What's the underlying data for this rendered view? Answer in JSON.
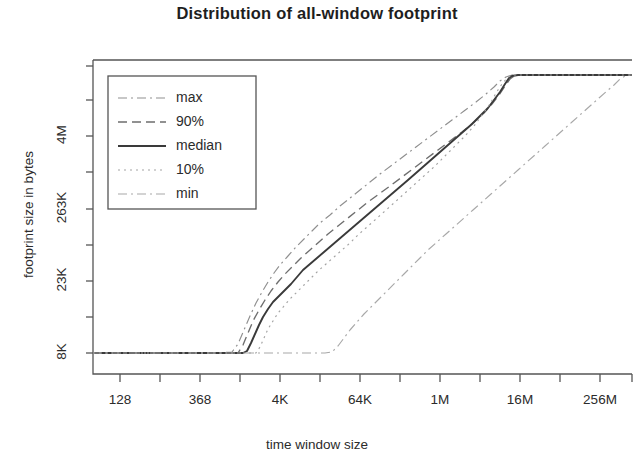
{
  "chart_data": {
    "type": "line",
    "title": "Distribution of all-window footprint",
    "xlabel": "time window size",
    "ylabel": "footprint size in bytes",
    "grid": false,
    "legend_position": "top-left",
    "x_tick_labels": [
      "128",
      "",
      "368",
      "",
      "4K",
      "",
      "64K",
      "",
      "1M",
      "",
      "16M",
      "",
      "256M",
      ""
    ],
    "y_tick_labels": [
      "8K",
      "",
      "23K",
      "",
      "263K",
      "",
      "4M",
      "",
      ""
    ],
    "xlim_labels": [
      "128",
      "256M"
    ],
    "ylim_labels": [
      "8K",
      "4M"
    ],
    "legend": [
      {
        "name": "max",
        "style": "dashdot",
        "color": "#8f8f8f"
      },
      {
        "name": "90%",
        "style": "dashed",
        "color": "#6e6e6e"
      },
      {
        "name": "median",
        "style": "solid",
        "color": "#3a3a3a"
      },
      {
        "name": "10%",
        "style": "dotted",
        "color": "#a3a3a3"
      },
      {
        "name": "min",
        "style": "dashdot",
        "color": "#a8a8a8"
      }
    ],
    "series": [
      {
        "name": "max",
        "style": "dashdot",
        "color": "#8f8f8f",
        "points": [
          [
            93,
            353
          ],
          [
            140,
            353
          ],
          [
            180,
            353
          ],
          [
            215,
            353
          ],
          [
            232,
            352
          ],
          [
            238,
            344
          ],
          [
            244,
            330
          ],
          [
            250,
            316
          ],
          [
            256,
            303
          ],
          [
            262,
            292
          ],
          [
            268,
            282
          ],
          [
            274,
            273
          ],
          [
            280,
            265
          ],
          [
            288,
            256
          ],
          [
            296,
            247
          ],
          [
            304,
            239
          ],
          [
            312,
            231
          ],
          [
            320,
            223
          ],
          [
            330,
            215
          ],
          [
            340,
            206
          ],
          [
            350,
            198
          ],
          [
            360,
            190
          ],
          [
            370,
            182
          ],
          [
            380,
            174
          ],
          [
            392,
            165
          ],
          [
            404,
            156
          ],
          [
            416,
            147
          ],
          [
            428,
            138
          ],
          [
            440,
            129
          ],
          [
            452,
            120
          ],
          [
            464,
            111
          ],
          [
            476,
            102
          ],
          [
            486,
            94
          ],
          [
            494,
            87
          ],
          [
            500,
            81
          ],
          [
            506,
            77
          ],
          [
            512,
            75
          ],
          [
            530,
            75
          ],
          [
            560,
            75
          ],
          [
            600,
            75
          ],
          [
            632,
            75
          ]
        ]
      },
      {
        "name": "90%",
        "style": "dashed",
        "color": "#6e6e6e",
        "points": [
          [
            93,
            353
          ],
          [
            150,
            353
          ],
          [
            200,
            353
          ],
          [
            230,
            353
          ],
          [
            238,
            353
          ],
          [
            243,
            345
          ],
          [
            248,
            333
          ],
          [
            253,
            321
          ],
          [
            259,
            310
          ],
          [
            265,
            300
          ],
          [
            271,
            291
          ],
          [
            278,
            282
          ],
          [
            285,
            274
          ],
          [
            293,
            266
          ],
          [
            301,
            258
          ],
          [
            310,
            250
          ],
          [
            319,
            242
          ],
          [
            328,
            234
          ],
          [
            338,
            226
          ],
          [
            348,
            218
          ],
          [
            358,
            210
          ],
          [
            368,
            202
          ],
          [
            379,
            194
          ],
          [
            390,
            186
          ],
          [
            402,
            177
          ],
          [
            414,
            168
          ],
          [
            426,
            159
          ],
          [
            438,
            150
          ],
          [
            450,
            141
          ],
          [
            462,
            132
          ],
          [
            474,
            122
          ],
          [
            484,
            113
          ],
          [
            492,
            104
          ],
          [
            499,
            95
          ],
          [
            505,
            86
          ],
          [
            510,
            79
          ],
          [
            514,
            76
          ],
          [
            520,
            75
          ],
          [
            560,
            75
          ],
          [
            600,
            75
          ],
          [
            632,
            75
          ]
        ]
      },
      {
        "name": "median",
        "style": "solid",
        "color": "#3a3a3a",
        "points": [
          [
            93,
            353
          ],
          [
            160,
            353
          ],
          [
            210,
            353
          ],
          [
            235,
            353
          ],
          [
            243,
            353
          ],
          [
            247,
            351
          ],
          [
            251,
            343
          ],
          [
            255,
            334
          ],
          [
            259,
            325
          ],
          [
            263,
            317
          ],
          [
            268,
            309
          ],
          [
            273,
            302
          ],
          [
            279,
            296
          ],
          [
            285,
            290
          ],
          [
            291,
            284
          ],
          [
            297,
            277
          ],
          [
            303,
            270
          ],
          [
            310,
            264
          ],
          [
            317,
            258
          ],
          [
            324,
            252
          ],
          [
            331,
            246
          ],
          [
            338,
            240
          ],
          [
            345,
            234
          ],
          [
            352,
            228
          ],
          [
            359,
            222
          ],
          [
            366,
            216
          ],
          [
            373,
            210
          ],
          [
            380,
            204
          ],
          [
            387,
            198
          ],
          [
            394,
            192
          ],
          [
            401,
            186
          ],
          [
            408,
            180
          ],
          [
            416,
            173
          ],
          [
            424,
            166
          ],
          [
            432,
            159
          ],
          [
            440,
            152
          ],
          [
            448,
            145
          ],
          [
            456,
            138
          ],
          [
            464,
            131
          ],
          [
            472,
            124
          ],
          [
            480,
            116
          ],
          [
            488,
            108
          ],
          [
            494,
            100
          ],
          [
            500,
            92
          ],
          [
            505,
            84
          ],
          [
            509,
            78
          ],
          [
            512,
            76
          ],
          [
            518,
            75
          ],
          [
            560,
            75
          ],
          [
            600,
            75
          ],
          [
            632,
            75
          ]
        ]
      },
      {
        "name": "10%",
        "style": "dotted",
        "color": "#a3a3a3",
        "points": [
          [
            93,
            353
          ],
          [
            170,
            353
          ],
          [
            220,
            353
          ],
          [
            248,
            353
          ],
          [
            256,
            353
          ],
          [
            260,
            347
          ],
          [
            264,
            338
          ],
          [
            268,
            329
          ],
          [
            273,
            321
          ],
          [
            278,
            313
          ],
          [
            284,
            306
          ],
          [
            290,
            299
          ],
          [
            297,
            292
          ],
          [
            304,
            285
          ],
          [
            311,
            278
          ],
          [
            318,
            271
          ],
          [
            326,
            264
          ],
          [
            334,
            257
          ],
          [
            342,
            250
          ],
          [
            350,
            243
          ],
          [
            358,
            235
          ],
          [
            367,
            227
          ],
          [
            376,
            219
          ],
          [
            385,
            211
          ],
          [
            395,
            202
          ],
          [
            405,
            193
          ],
          [
            415,
            184
          ],
          [
            425,
            175
          ],
          [
            435,
            166
          ],
          [
            445,
            156
          ],
          [
            455,
            146
          ],
          [
            465,
            136
          ],
          [
            474,
            126
          ],
          [
            482,
            115
          ],
          [
            490,
            104
          ],
          [
            496,
            93
          ],
          [
            502,
            84
          ],
          [
            507,
            78
          ],
          [
            512,
            75
          ],
          [
            560,
            75
          ],
          [
            600,
            75
          ],
          [
            632,
            75
          ]
        ]
      },
      {
        "name": "min",
        "style": "dashdot",
        "color": "#a8a8a8",
        "points": [
          [
            93,
            353
          ],
          [
            180,
            353
          ],
          [
            250,
            353
          ],
          [
            300,
            353
          ],
          [
            325,
            353
          ],
          [
            332,
            352
          ],
          [
            338,
            346
          ],
          [
            344,
            338
          ],
          [
            350,
            330
          ],
          [
            357,
            322
          ],
          [
            364,
            314
          ],
          [
            372,
            306
          ],
          [
            380,
            298
          ],
          [
            388,
            290
          ],
          [
            396,
            282
          ],
          [
            404,
            274
          ],
          [
            412,
            266
          ],
          [
            420,
            258
          ],
          [
            428,
            250
          ],
          [
            437,
            242
          ],
          [
            446,
            234
          ],
          [
            455,
            226
          ],
          [
            464,
            218
          ],
          [
            473,
            210
          ],
          [
            482,
            202
          ],
          [
            491,
            194
          ],
          [
            500,
            186
          ],
          [
            509,
            178
          ],
          [
            518,
            170
          ],
          [
            527,
            162
          ],
          [
            536,
            154
          ],
          [
            545,
            146
          ],
          [
            554,
            138
          ],
          [
            563,
            130
          ],
          [
            572,
            122
          ],
          [
            581,
            114
          ],
          [
            590,
            106
          ],
          [
            599,
            98
          ],
          [
            607,
            91
          ],
          [
            614,
            85
          ],
          [
            620,
            79
          ],
          [
            625,
            76
          ],
          [
            630,
            75
          ],
          [
            632,
            75
          ]
        ]
      }
    ]
  },
  "plot_frame": {
    "left": 93,
    "top": 60,
    "right": 632,
    "bottom": 374
  },
  "y_ticks": [
    {
      "label": "8K",
      "y": 353
    },
    {
      "label": "",
      "y": 317
    },
    {
      "label": "23K",
      "y": 281
    },
    {
      "label": "",
      "y": 245
    },
    {
      "label": "263K",
      "y": 209
    },
    {
      "label": "",
      "y": 172
    },
    {
      "label": "4M",
      "y": 136
    },
    {
      "label": "",
      "y": 100
    },
    {
      "label": "",
      "y": 66
    }
  ],
  "x_ticks": [
    {
      "label": "128",
      "x": 120
    },
    {
      "label": "",
      "x": 160
    },
    {
      "label": "368",
      "x": 200
    },
    {
      "label": "",
      "x": 240
    },
    {
      "label": "4K",
      "x": 280
    },
    {
      "label": "",
      "x": 320
    },
    {
      "label": "64K",
      "x": 360
    },
    {
      "label": "",
      "x": 400
    },
    {
      "label": "1M",
      "x": 440
    },
    {
      "label": "",
      "x": 480
    },
    {
      "label": "16M",
      "x": 520
    },
    {
      "label": "",
      "x": 560
    },
    {
      "label": "256M",
      "x": 600
    },
    {
      "label": "",
      "x": 632
    }
  ],
  "legend_box": {
    "left": 108,
    "top": 76,
    "width": 148,
    "height": 133
  }
}
